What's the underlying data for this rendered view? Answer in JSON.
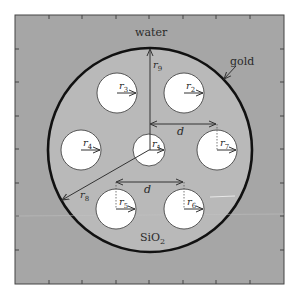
{
  "figure": {
    "type": "fiber cross-section schematic",
    "colors": {
      "outer_medium": "#a6a6a6",
      "core_region": "#b9b9b9",
      "holes": "#ffffff",
      "gold_ring": "#111111",
      "frame": "#444444",
      "annotation": "#333333"
    },
    "labels": {
      "outer_medium": "water",
      "ring": "gold",
      "core_material": "SiO",
      "core_material_sub": "2"
    },
    "radii": {
      "r1": {
        "main": "r",
        "sub": "1"
      },
      "r2": {
        "main": "r",
        "sub": "2"
      },
      "r3": {
        "main": "r",
        "sub": "3"
      },
      "r4": {
        "main": "r",
        "sub": "4"
      },
      "r5": {
        "main": "r",
        "sub": "5"
      },
      "r6": {
        "main": "r",
        "sub": "6"
      },
      "r7": {
        "main": "r",
        "sub": "7"
      },
      "r8": {
        "main": "r",
        "sub": "8"
      },
      "r9": {
        "main": "r",
        "sub": "9"
      }
    },
    "pitch": {
      "top": "d",
      "bottom": "d"
    },
    "holes": [
      {
        "id": "r1",
        "cx": 149,
        "cy": 150,
        "r": 16
      },
      {
        "id": "r2",
        "cx": 184,
        "cy": 93,
        "r": 20
      },
      {
        "id": "r3",
        "cx": 117,
        "cy": 93,
        "r": 20
      },
      {
        "id": "r4",
        "cx": 81,
        "cy": 150,
        "r": 20
      },
      {
        "id": "r5",
        "cx": 116,
        "cy": 209,
        "r": 20
      },
      {
        "id": "r6",
        "cx": 184,
        "cy": 209,
        "r": 20
      },
      {
        "id": "r7",
        "cx": 217,
        "cy": 150,
        "r": 20
      }
    ],
    "ring": {
      "cx": 150,
      "cy": 150,
      "r": 102
    },
    "axis_ticks": [
      49,
      82,
      116,
      149,
      183,
      216,
      250
    ]
  }
}
